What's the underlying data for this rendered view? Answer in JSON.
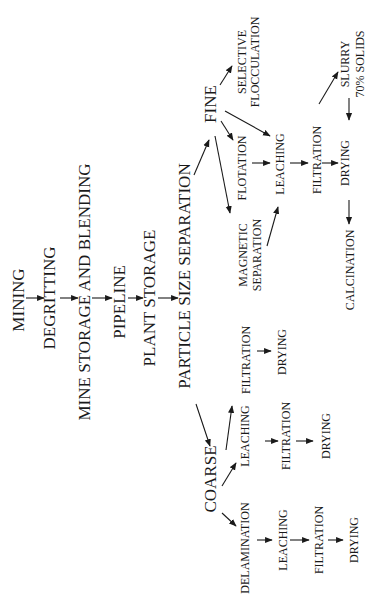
{
  "orientation": "rotated 90 degrees counter-clockwise",
  "colors": {
    "background": "#ffffff",
    "ink": "#1a1a1a"
  },
  "main_chain": {
    "mining": "MINING",
    "degritting": "DEGRITTING",
    "mine_storage": "MINE STORAGE AND BLENDING",
    "pipeline": "PIPELINE",
    "plant_storage": "PLANT STORAGE",
    "particle_size_separation": "PARTICLE SIZE SEPARATION"
  },
  "fine_branch": {
    "fine": "FINE",
    "selective_1": "SELECTIVE",
    "selective_2": "FLOCCULATION",
    "flotation": "FLOTATION",
    "magnetic_1": "MAGNETIC",
    "magnetic_2": "SEPARATION",
    "leaching": "LEACHING",
    "filtration": "FILTRATION",
    "drying": "DRYING",
    "slurry_1": "SLURRY",
    "slurry_2": "70% SOLIDS",
    "calcination": "CALCINATION"
  },
  "mid_branch": {
    "filtration": "FILTRATION",
    "drying": "DRYING"
  },
  "coarse_branch": {
    "coarse": "COARSE",
    "leaching_path": {
      "leaching": "LEACHING",
      "filtration": "FILTRATION",
      "drying": "DRYING"
    },
    "delamination_path": {
      "delamination": "DELAMINATION",
      "leaching": "LEACHING",
      "filtration": "FILTRATION",
      "drying": "DRYING"
    }
  },
  "edges": [
    [
      "MINING",
      "DEGRITTING"
    ],
    [
      "DEGRITTING",
      "MINE STORAGE AND BLENDING"
    ],
    [
      "MINE STORAGE AND BLENDING",
      "PIPELINE"
    ],
    [
      "PIPELINE",
      "PLANT STORAGE"
    ],
    [
      "PLANT STORAGE",
      "PARTICLE SIZE SEPARATION"
    ],
    [
      "PARTICLE SIZE SEPARATION",
      "FINE"
    ],
    [
      "PARTICLE SIZE SEPARATION",
      "COARSE"
    ],
    [
      "FINE",
      "SELECTIVE FLOCCULATION"
    ],
    [
      "FINE",
      "FLOTATION"
    ],
    [
      "FINE",
      "LEACHING"
    ],
    [
      "FINE",
      "MAGNETIC SEPARATION"
    ],
    [
      "FLOTATION",
      "LEACHING"
    ],
    [
      "MAGNETIC SEPARATION",
      "LEACHING"
    ],
    [
      "LEACHING",
      "FILTRATION"
    ],
    [
      "FILTRATION",
      "DRYING"
    ],
    [
      "FILTRATION",
      "SLURRY 70% SOLIDS"
    ],
    [
      "SLURRY 70% SOLIDS",
      "DRYING"
    ],
    [
      "DRYING",
      "CALCINATION"
    ],
    [
      "COARSE",
      "FILTRATION (mid)"
    ],
    [
      "FILTRATION (mid)",
      "DRYING (mid)"
    ],
    [
      "COARSE",
      "LEACHING (coarse)"
    ],
    [
      "LEACHING (coarse)",
      "FILTRATION (coarse)"
    ],
    [
      "FILTRATION (coarse)",
      "DRYING (coarse)"
    ],
    [
      "COARSE",
      "DELAMINATION"
    ],
    [
      "DELAMINATION",
      "LEACHING (delam)"
    ],
    [
      "LEACHING (delam)",
      "FILTRATION (delam)"
    ],
    [
      "FILTRATION (delam)",
      "DRYING (delam)"
    ]
  ]
}
